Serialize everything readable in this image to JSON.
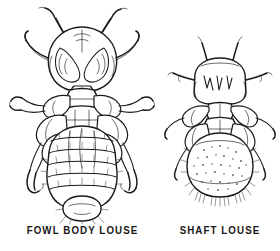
{
  "plate": {
    "background_color": "#ffffff",
    "ink_color": "#1a1a1a",
    "caption_color": "#171717",
    "style": "pen-and-ink scientific line drawing",
    "subject": "poultry lice comparison plate",
    "figure_count": 2
  },
  "figures": [
    {
      "id": "fowl-body-louse",
      "caption": "FOWL BODY LOUSE",
      "description": "Elongate dorsal-view chewing louse with broad rounded head, two segmented antennae, three pairs of legs and a long segmented abdomen bearing rows of bristles.",
      "relative_size": "larger",
      "abdomen_segments": 7,
      "leg_pairs": 3,
      "antennae": 2
    },
    {
      "id": "shaft-louse",
      "caption": "SHAFT LOUSE",
      "description": "Smaller dorsal-view chewing louse with squarish head, short antennae, three pairs of legs and a rounded stippled abdomen fringed with bristles.",
      "relative_size": "smaller",
      "abdomen_segments": 1,
      "leg_pairs": 3,
      "antennae": 2
    }
  ]
}
